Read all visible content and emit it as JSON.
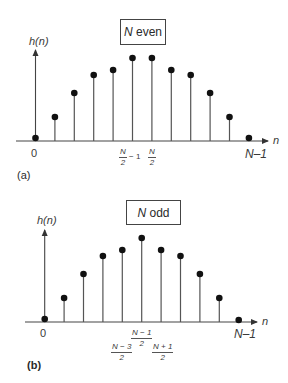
{
  "panels": [
    {
      "id": "a",
      "tag": "(a)",
      "box_label_italic": "N",
      "box_label_rest": " even",
      "ylabel": "h(n)",
      "xlabel": "n",
      "origin_label": "0",
      "end_label": "N–1",
      "mid_labels": [
        {
          "num": "N",
          "den": "2",
          "suffix": "− 1"
        },
        {
          "num": "N",
          "den": "2",
          "suffix": ""
        }
      ]
    },
    {
      "id": "b",
      "tag": "(b)",
      "box_label_italic": "N",
      "box_label_rest": " odd",
      "ylabel": "h(n)",
      "xlabel": "n",
      "origin_label": "0",
      "end_label": "N–1",
      "mid_labels": [
        {
          "num": "N − 3",
          "den": "2"
        },
        {
          "num": "N − 1",
          "den": "2"
        },
        {
          "num": "N + 1",
          "den": "2"
        }
      ]
    }
  ],
  "chart_data": [
    {
      "type": "stem",
      "title": "N even",
      "xlabel": "n",
      "ylabel": "h(n)",
      "x": [
        0,
        1,
        2,
        3,
        4,
        5,
        6,
        7,
        8,
        9,
        10,
        11
      ],
      "x_tick_labels": {
        "0": "0",
        "5": "N/2 − 1",
        "6": "N/2",
        "11": "N−1"
      },
      "values": [
        3,
        24,
        48,
        66,
        71,
        83,
        83,
        71,
        66,
        48,
        24,
        3
      ],
      "symmetry": "even-symmetric about (N-1)/2",
      "units": "relative amplitude (px)"
    },
    {
      "type": "stem",
      "title": "N odd",
      "xlabel": "n",
      "ylabel": "h(n)",
      "x": [
        0,
        1,
        2,
        3,
        4,
        5,
        6,
        7,
        8,
        9,
        10
      ],
      "x_tick_labels": {
        "0": "0",
        "4": "(N−3)/2",
        "5": "(N−1)/2",
        "6": "(N+1)/2",
        "10": "N−1"
      },
      "values": [
        3,
        24,
        48,
        66,
        72,
        84,
        72,
        66,
        48,
        24,
        2
      ],
      "symmetry": "even-symmetric about (N-1)/2",
      "units": "relative amplitude (px)"
    }
  ]
}
